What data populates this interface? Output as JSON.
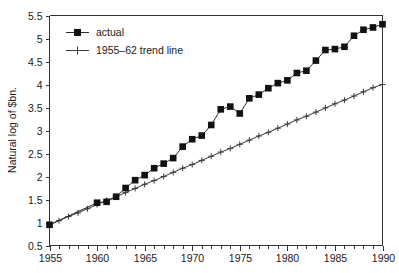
{
  "chart_data": {
    "type": "line",
    "title": "",
    "subtitle": "",
    "xlabel": "",
    "ylabel": "Natural log of $bn.",
    "xlim": [
      1955,
      1990
    ],
    "ylim": [
      0.5,
      5.5
    ],
    "grid": false,
    "legend_position": "top-left",
    "x_ticks_major": [
      "1955",
      "1960",
      "1965",
      "1970",
      "1975",
      "1980",
      "1985",
      "1990"
    ],
    "x_tick_values_major": [
      1955,
      1960,
      1965,
      1970,
      1975,
      1980,
      1985,
      1990
    ],
    "x_tick_values_minor": [
      1956,
      1957,
      1958,
      1959,
      1961,
      1962,
      1963,
      1964,
      1966,
      1967,
      1968,
      1969,
      1971,
      1972,
      1973,
      1974,
      1976,
      1977,
      1978,
      1979,
      1981,
      1982,
      1983,
      1984,
      1986,
      1987,
      1988,
      1989
    ],
    "y_ticks": [
      "0.5",
      "1",
      "1.5",
      "2",
      "2.5",
      "3",
      "3.5",
      "4",
      "4.5",
      "5",
      "5.5"
    ],
    "y_tick_values": [
      0.5,
      1,
      1.5,
      2,
      2.5,
      3,
      3.5,
      4,
      4.5,
      5,
      5.5
    ],
    "series": [
      {
        "name": "actual",
        "marker": "filled-square",
        "color": "#111111",
        "x": [
          1955,
          1960,
          1961,
          1962,
          1963,
          1964,
          1965,
          1966,
          1967,
          1968,
          1969,
          1970,
          1971,
          1972,
          1973,
          1974,
          1975,
          1976,
          1977,
          1978,
          1979,
          1980,
          1981,
          1982,
          1983,
          1984,
          1985,
          1986,
          1987,
          1988,
          1989,
          1990
        ],
        "values": [
          0.95,
          1.43,
          1.45,
          1.56,
          1.75,
          1.92,
          2.03,
          2.18,
          2.28,
          2.4,
          2.65,
          2.81,
          2.89,
          3.12,
          3.46,
          3.52,
          3.37,
          3.7,
          3.78,
          3.92,
          4.03,
          4.09,
          4.25,
          4.3,
          4.52,
          4.75,
          4.77,
          4.82,
          5.06,
          5.19,
          5.24,
          5.31
        ]
      },
      {
        "name": "1955–62 trend line",
        "marker": "plus",
        "color": "#3a3a3a",
        "x": [
          1955,
          1956,
          1957,
          1958,
          1959,
          1960,
          1961,
          1962,
          1963,
          1964,
          1965,
          1966,
          1967,
          1968,
          1969,
          1970,
          1971,
          1972,
          1973,
          1974,
          1975,
          1976,
          1977,
          1978,
          1979,
          1980,
          1981,
          1982,
          1983,
          1984,
          1985,
          1986,
          1987,
          1988,
          1989,
          1990
        ],
        "values": [
          0.95,
          1.04,
          1.13,
          1.21,
          1.3,
          1.39,
          1.48,
          1.56,
          1.65,
          1.74,
          1.83,
          1.91,
          2.0,
          2.09,
          2.18,
          2.26,
          2.35,
          2.44,
          2.53,
          2.61,
          2.7,
          2.79,
          2.88,
          2.96,
          3.05,
          3.14,
          3.23,
          3.31,
          3.4,
          3.49,
          3.58,
          3.66,
          3.75,
          3.84,
          3.93,
          4.0
        ]
      }
    ]
  },
  "legend": {
    "entries": [
      {
        "label": "actual"
      },
      {
        "label": "1955–62 trend line"
      }
    ]
  },
  "axes": {
    "y_title": "Natural log of $bn."
  }
}
